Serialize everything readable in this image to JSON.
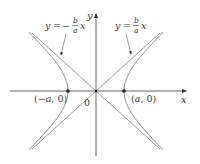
{
  "figure": {
    "type": "hyperbola-diagram",
    "axes": {
      "x_label": "x",
      "y_label": "y",
      "origin_label": "0"
    },
    "vertices": [
      {
        "label": "(−a, 0)",
        "label_a": "a",
        "label_neg": "(−",
        "label_tail": ", 0)"
      },
      {
        "label": "(a, 0)",
        "label_open": "(",
        "label_a": "a",
        "label_tail": ", 0)"
      }
    ],
    "asymptotes": [
      {
        "label": "y = − b/a x",
        "lhs": "y",
        "eq": "=",
        "sign": "−",
        "num": "b",
        "den": "a",
        "var": "x"
      },
      {
        "label": "y = b/a x",
        "lhs": "y",
        "eq": "=",
        "num": "b",
        "den": "a",
        "var": "x"
      }
    ],
    "colors": {
      "curve": "#888888",
      "axis": "#555555",
      "text": "#3a3a3a",
      "background": "#ffffff"
    }
  }
}
